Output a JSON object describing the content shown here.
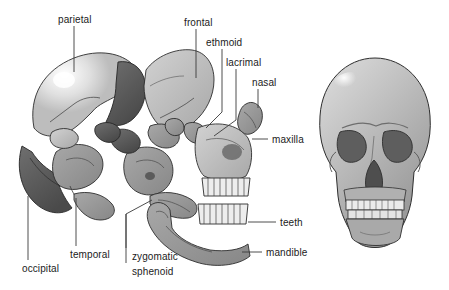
{
  "figure": {
    "background_color": "#ffffff",
    "label_text_color": "#1b1b1b",
    "leader_line_color": "#3a3a3a",
    "palette": {
      "bone_light": "#c2c2c2",
      "bone_mid": "#9d9d9d",
      "bone_dark": "#6a6a6a",
      "bone_darker": "#4e4e4e",
      "bone_shadow": "#3a3a3a",
      "tooth": "#ededed",
      "highlight": "#f2f2f2",
      "outline": "#2e2e2e"
    },
    "views": [
      {
        "name": "exploded-skull-lateral",
        "description": "Left lateral exploded view with individual cranial and facial bones separated",
        "x": 8,
        "y": 40,
        "width": 275,
        "height": 245
      },
      {
        "name": "intact-skull-anterior",
        "description": "Intact anterior view of assembled skull",
        "x": 316,
        "y": 58,
        "width": 118,
        "height": 195
      }
    ],
    "labels": [
      {
        "id": "parietal",
        "text": "parietal",
        "text_x": 58,
        "text_y": 14,
        "leader": {
          "type": "vertical",
          "x": 74,
          "y1": 26,
          "y2": 72
        }
      },
      {
        "id": "frontal",
        "text": "frontal",
        "text_x": 184,
        "text_y": 17,
        "leader": {
          "type": "vertical",
          "x": 196,
          "y1": 29,
          "y2": 78
        }
      },
      {
        "id": "ethmoid",
        "text": "ethmoid",
        "text_x": 206,
        "text_y": 37,
        "leader": {
          "type": "polyline",
          "points": "222,49 222,112 206,128"
        }
      },
      {
        "id": "lacrimal",
        "text": "lacrimal",
        "text_x": 226,
        "text_y": 57,
        "leader": {
          "type": "polyline",
          "points": "236,69 236,120 214,136"
        }
      },
      {
        "id": "nasal",
        "text": "nasal",
        "text_x": 252,
        "text_y": 77,
        "leader": {
          "type": "vertical",
          "x": 258,
          "y1": 89,
          "y2": 108
        }
      },
      {
        "id": "maxilla",
        "text": "maxilla",
        "text_x": 272,
        "text_y": 134,
        "leader": {
          "type": "horizontal",
          "y": 139,
          "x1": 252,
          "x2": 268
        }
      },
      {
        "id": "teeth",
        "text": "teeth",
        "text_x": 280,
        "text_y": 217,
        "leader": {
          "type": "horizontal",
          "y": 222,
          "x1": 248,
          "x2": 276
        }
      },
      {
        "id": "mandible",
        "text": "mandible",
        "text_x": 266,
        "text_y": 247,
        "leader": {
          "type": "horizontal",
          "y": 252,
          "x1": 242,
          "x2": 262
        }
      },
      {
        "id": "occipital",
        "text": "occipital",
        "text_x": 22,
        "text_y": 263,
        "leader": {
          "type": "vertical",
          "x": 28,
          "y1": 196,
          "y2": 260
        }
      },
      {
        "id": "temporal",
        "text": "temporal",
        "text_x": 70,
        "text_y": 249,
        "leader": {
          "type": "vertical",
          "x": 76,
          "y1": 198,
          "y2": 246
        }
      },
      {
        "id": "zygomatic",
        "text": "zygomatic",
        "text_x": 132,
        "text_y": 251,
        "leader": {
          "type": "polyline",
          "points": "126,248 126,214 152,200"
        }
      },
      {
        "id": "sphenoid",
        "text": "sphenoid",
        "text_x": 132,
        "text_y": 266,
        "leader": {
          "type": "vertical",
          "x": 126,
          "y1": 214,
          "y2": 263
        }
      }
    ]
  }
}
